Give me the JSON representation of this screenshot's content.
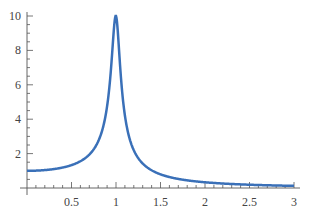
{
  "chart_data": {
    "type": "line",
    "title": "",
    "xlabel": "",
    "ylabel": "",
    "xlim": [
      0,
      3
    ],
    "ylim": [
      0,
      10
    ],
    "grid": false,
    "legend": null,
    "x_ticks": [
      "0.5",
      "1",
      "1.5",
      "2",
      "2.5",
      "3"
    ],
    "y_ticks": [
      "2",
      "4",
      "6",
      "8",
      "10"
    ],
    "line_color": "#3a70b8",
    "series": [
      {
        "name": "amplitude",
        "x": [
          0,
          0.25,
          0.5,
          0.7,
          0.8,
          0.9,
          0.95,
          1.0,
          1.05,
          1.1,
          1.2,
          1.3,
          1.5,
          2.0,
          2.5,
          3.0
        ],
        "values": [
          1.0,
          1.07,
          1.33,
          1.96,
          2.77,
          5.0,
          7.4,
          10.0,
          6.9,
          4.5,
          2.25,
          1.44,
          0.8,
          0.33,
          0.19,
          0.125
        ]
      }
    ]
  }
}
